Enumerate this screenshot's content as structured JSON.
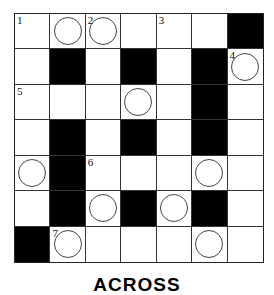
{
  "puzzle": {
    "rows": 7,
    "cols": 7,
    "cells": [
      [
        {
          "t": "w",
          "n": "1"
        },
        {
          "t": "w",
          "c": true
        },
        {
          "t": "w",
          "n": "2",
          "c": true
        },
        {
          "t": "w"
        },
        {
          "t": "w",
          "n": "3"
        },
        {
          "t": "w"
        },
        {
          "t": "b"
        }
      ],
      [
        {
          "t": "w"
        },
        {
          "t": "b"
        },
        {
          "t": "w"
        },
        {
          "t": "b"
        },
        {
          "t": "w"
        },
        {
          "t": "b"
        },
        {
          "t": "w",
          "n": "4",
          "c": true
        }
      ],
      [
        {
          "t": "w",
          "n": "5"
        },
        {
          "t": "w"
        },
        {
          "t": "w"
        },
        {
          "t": "w",
          "c": true
        },
        {
          "t": "w"
        },
        {
          "t": "b"
        },
        {
          "t": "w"
        }
      ],
      [
        {
          "t": "w"
        },
        {
          "t": "b"
        },
        {
          "t": "w"
        },
        {
          "t": "b"
        },
        {
          "t": "w"
        },
        {
          "t": "b"
        },
        {
          "t": "w"
        }
      ],
      [
        {
          "t": "w",
          "c": true
        },
        {
          "t": "b"
        },
        {
          "t": "w",
          "n": "6"
        },
        {
          "t": "w"
        },
        {
          "t": "w"
        },
        {
          "t": "w",
          "c": true
        },
        {
          "t": "w"
        }
      ],
      [
        {
          "t": "w"
        },
        {
          "t": "b"
        },
        {
          "t": "w",
          "c": true
        },
        {
          "t": "b"
        },
        {
          "t": "w",
          "c": true
        },
        {
          "t": "b"
        },
        {
          "t": "w"
        }
      ],
      [
        {
          "t": "b"
        },
        {
          "t": "w",
          "n": "7",
          "c": true
        },
        {
          "t": "w"
        },
        {
          "t": "w"
        },
        {
          "t": "w"
        },
        {
          "t": "w",
          "c": true
        },
        {
          "t": "w"
        }
      ]
    ]
  },
  "heading": "ACROSS"
}
